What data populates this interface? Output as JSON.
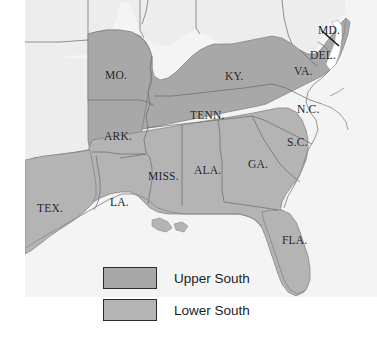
{
  "figure": {
    "name": "map-of-upper-and-lower-south",
    "background_color": "#ffffff"
  },
  "colors": {
    "upper_south_fill": "#a8a8a8",
    "lower_south_fill": "#b4b4b4",
    "unshaded_fill": "#eeeeee",
    "border_stroke": "#6b6b6b",
    "outline_stroke": "#787878",
    "label_color": "#1a1a1a",
    "legend_border": "#2b2b2b"
  },
  "map": {
    "state_labels": [
      {
        "id": "missouri",
        "text": "MO.",
        "x": 105,
        "y": 70,
        "region": "Upper South"
      },
      {
        "id": "kentucky",
        "text": "KY.",
        "x": 225,
        "y": 71,
        "region": "Upper South"
      },
      {
        "id": "virginia",
        "text": "VA.",
        "x": 294,
        "y": 66,
        "region": "Upper South"
      },
      {
        "id": "maryland",
        "text": "MD.",
        "x": 318,
        "y": 25,
        "region": "Upper South"
      },
      {
        "id": "delaware",
        "text": "DEL.",
        "x": 310,
        "y": 50,
        "region": "Upper South"
      },
      {
        "id": "north-carolina",
        "text": "N.C.",
        "x": 297,
        "y": 104,
        "region": "Upper South"
      },
      {
        "id": "tennessee",
        "text": "TENN.",
        "x": 190,
        "y": 110,
        "region": "Upper South"
      },
      {
        "id": "arkansas",
        "text": "ARK.",
        "x": 104,
        "y": 131,
        "region": "Upper South"
      },
      {
        "id": "south-carolina",
        "text": "S.C.",
        "x": 287,
        "y": 137,
        "region": "Lower South"
      },
      {
        "id": "georgia",
        "text": "GA.",
        "x": 248,
        "y": 159,
        "region": "Lower South"
      },
      {
        "id": "alabama",
        "text": "ALA.",
        "x": 194,
        "y": 165,
        "region": "Lower South"
      },
      {
        "id": "mississippi",
        "text": "MISS.",
        "x": 148,
        "y": 171,
        "region": "Lower South"
      },
      {
        "id": "louisiana",
        "text": "LA.",
        "x": 110,
        "y": 197,
        "region": "Lower South"
      },
      {
        "id": "texas",
        "text": "TEX.",
        "x": 37,
        "y": 203,
        "region": "Lower South"
      },
      {
        "id": "florida",
        "text": "FLA.",
        "x": 282,
        "y": 235,
        "region": "Lower South"
      }
    ]
  },
  "legend": {
    "entries": [
      {
        "id": "upper-south",
        "label": "Upper South",
        "swatch_color": "#a8a8a8"
      },
      {
        "id": "lower-south",
        "label": "Lower South",
        "swatch_color": "#b4b4b4"
      }
    ]
  }
}
